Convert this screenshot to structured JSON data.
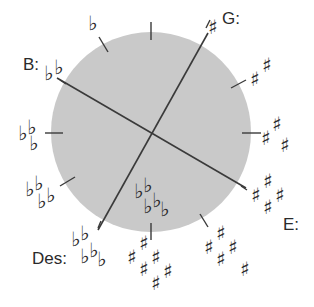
{
  "diagram": {
    "title": "",
    "circle": {
      "cx": 151,
      "cy": 132,
      "r": 100,
      "fill": "#c9c9c9"
    },
    "line_color": "#3a3a3a",
    "labels": [
      {
        "id": "G",
        "text": "G:",
        "x": 222,
        "y": 24
      },
      {
        "id": "B",
        "text": "B:",
        "x": 23,
        "y": 70
      },
      {
        "id": "E",
        "text": "E:",
        "x": 283,
        "y": 230
      },
      {
        "id": "Des",
        "text": "Des:",
        "x": 32,
        "y": 264
      }
    ],
    "lines": [
      {
        "name": "B-E axis",
        "x1": 57,
        "y1": 78,
        "x2": 246,
        "y2": 188
      },
      {
        "name": "G-Des axis",
        "x1": 208,
        "y1": 33,
        "x2": 98,
        "y2": 230
      }
    ],
    "positions": [
      {
        "angle_deg": 0,
        "accidental": "none",
        "count": 0
      },
      {
        "angle_deg": 30,
        "accidental": "sharp",
        "count": 1
      },
      {
        "angle_deg": 60,
        "accidental": "sharp",
        "count": 2
      },
      {
        "angle_deg": 90,
        "accidental": "sharp",
        "count": 3
      },
      {
        "angle_deg": 120,
        "accidental": "sharp",
        "count": 4
      },
      {
        "angle_deg": 150,
        "accidental": "sharp",
        "count": 5
      },
      {
        "angle_deg": 180,
        "accidental": "sharp",
        "count": 6,
        "also_flat_count": 6
      },
      {
        "angle_deg": 210,
        "accidental": "flat",
        "count": 5
      },
      {
        "angle_deg": 240,
        "accidental": "flat",
        "count": 4
      },
      {
        "angle_deg": 270,
        "accidental": "flat",
        "count": 3
      },
      {
        "angle_deg": 300,
        "accidental": "flat",
        "count": 2
      },
      {
        "angle_deg": 330,
        "accidental": "flat",
        "count": 1
      }
    ],
    "glyphs": {
      "sharp": "♯",
      "flat": "♭"
    }
  }
}
